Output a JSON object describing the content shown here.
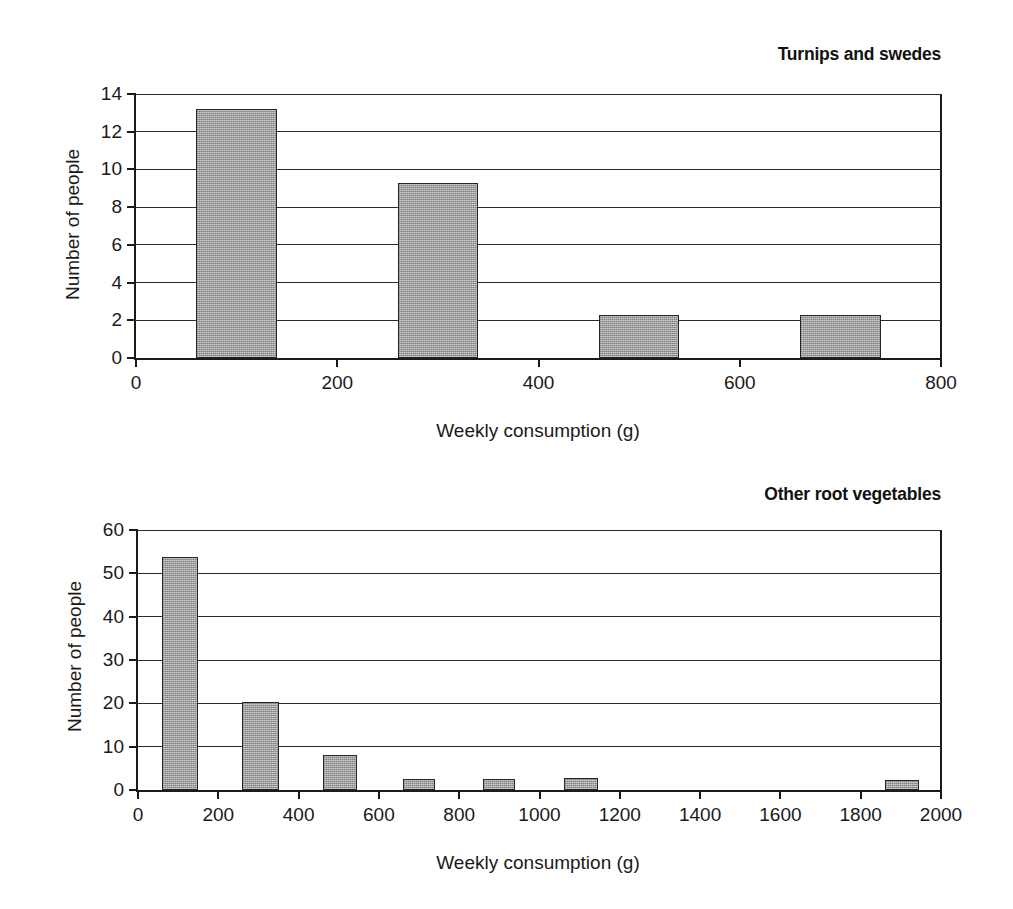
{
  "chart_data": [
    {
      "type": "bar",
      "id": "turnips-and-swedes",
      "title": "Turnips and swedes",
      "xlabel": "Weekly consumption (g)",
      "ylabel": "Number of people",
      "xlim": [
        0,
        800
      ],
      "ylim": [
        0,
        14
      ],
      "xticks": [
        0,
        200,
        400,
        600,
        800
      ],
      "xticklabels": [
        "0",
        "200",
        "400",
        "600",
        "800"
      ],
      "yticks": [
        0,
        2,
        4,
        6,
        8,
        10,
        12,
        14
      ],
      "yticklabels": [
        "0",
        "2",
        "4",
        "6",
        "8",
        "10",
        "12",
        "14"
      ],
      "grid": "horizontal",
      "legend": "none",
      "bar_color": "#9e9e9e",
      "bar_edge_color": "#262626",
      "bins": [
        {
          "x0": 60,
          "x1": 140,
          "value": 13.2
        },
        {
          "x0": 260,
          "x1": 340,
          "value": 9.3
        },
        {
          "x0": 460,
          "x1": 540,
          "value": 2.3
        },
        {
          "x0": 660,
          "x1": 740,
          "value": 2.3
        }
      ]
    },
    {
      "type": "bar",
      "id": "other-root-vegetables",
      "title": "Other root vegetables",
      "xlabel": "Weekly consumption (g)",
      "ylabel": "Number of people",
      "xlim": [
        0,
        2000
      ],
      "ylim": [
        0,
        60
      ],
      "xticks": [
        0,
        200,
        400,
        600,
        800,
        1000,
        1200,
        1400,
        1600,
        1800,
        2000
      ],
      "xticklabels": [
        "0",
        "200",
        "400",
        "600",
        "800",
        "1000",
        "1200",
        "1400",
        "1600",
        "1800",
        "2000"
      ],
      "yticks": [
        0,
        10,
        20,
        30,
        40,
        50,
        60
      ],
      "yticklabels": [
        "0",
        "10",
        "20",
        "30",
        "40",
        "50",
        "60"
      ],
      "grid": "horizontal",
      "legend": "none",
      "bar_color": "#9e9e9e",
      "bar_edge_color": "#262626",
      "bins": [
        {
          "x0": 60,
          "x1": 150,
          "value": 53.7
        },
        {
          "x0": 260,
          "x1": 350,
          "value": 20.2
        },
        {
          "x0": 460,
          "x1": 545,
          "value": 8.0
        },
        {
          "x0": 660,
          "x1": 740,
          "value": 2.5
        },
        {
          "x0": 860,
          "x1": 940,
          "value": 2.6
        },
        {
          "x0": 1060,
          "x1": 1145,
          "value": 2.8
        },
        {
          "x0": 1860,
          "x1": 1945,
          "value": 2.4
        }
      ]
    }
  ]
}
